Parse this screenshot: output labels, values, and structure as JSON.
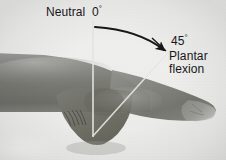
{
  "figure": {
    "background_color": "#f1f1ef",
    "annotation_color": "#17171a",
    "reference_line_color": "#f7f7f5"
  },
  "labels": {
    "neutral": "Neutral",
    "zero_value": "0",
    "degree_symbol": "°",
    "angle_value": "45",
    "motion_line1": "Plantar",
    "motion_line2": "flexion"
  },
  "measurements": {
    "neutral_degrees": 0,
    "plantar_flexion_degrees": 45,
    "unit": "degrees"
  },
  "annotations": {
    "vertical_reference": {
      "name": "neutral-reference-line",
      "from": [
        93,
        22
      ],
      "to": [
        93,
        136
      ]
    },
    "angle_ray": {
      "name": "plantar-flexion-ray",
      "from": [
        93,
        136
      ],
      "to": [
        172,
        48
      ]
    },
    "arc_arrow": {
      "name": "rotation-arc-arrow",
      "start": [
        95,
        27
      ],
      "end": [
        167,
        53
      ],
      "direction": "clockwise"
    },
    "leader_45": {
      "name": "angle-leader-line",
      "from": [
        152,
        38
      ],
      "to": [
        167,
        52
      ]
    }
  }
}
